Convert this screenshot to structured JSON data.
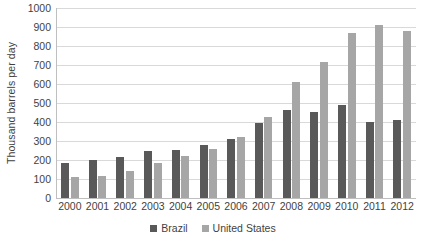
{
  "chart_data": {
    "type": "bar",
    "title": "",
    "subtitle": "",
    "xlabel": "",
    "ylabel": "Thousand barrels per day",
    "ylim": [
      0,
      1000
    ],
    "ytick_step": 100,
    "yticks": [
      0,
      100,
      200,
      300,
      400,
      500,
      600,
      700,
      800,
      900,
      1000
    ],
    "ytick_labels": [
      "0",
      "100",
      "200",
      "300",
      "400",
      "500",
      "600",
      "700",
      "800",
      "900",
      "1000"
    ],
    "categories": [
      "2000",
      "2001",
      "2002",
      "2003",
      "2004",
      "2005",
      "2006",
      "2007",
      "2008",
      "2009",
      "2010",
      "2011",
      "2012"
    ],
    "series": [
      {
        "name": "Brazil",
        "color": "#595959",
        "values": [
          185,
          200,
          218,
          248,
          252,
          278,
          308,
          395,
          465,
          455,
          490,
          400,
          410
        ]
      },
      {
        "name": "United States",
        "color": "#a6a6a6",
        "values": [
          108,
          118,
          143,
          185,
          222,
          258,
          320,
          425,
          610,
          715,
          870,
          910,
          880
        ]
      }
    ],
    "grid": true,
    "grid_axis": "y",
    "legend_position": "bottom",
    "legend_entries": [
      "Brazil",
      "United States"
    ],
    "colors": {
      "series_brazil": "#595959",
      "series_united_states": "#a6a6a6",
      "gridline": "#d9d9d9",
      "axis": "#bfbfbf",
      "text": "#3f3f3f",
      "background": "#ffffff"
    }
  }
}
